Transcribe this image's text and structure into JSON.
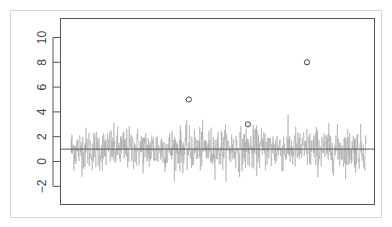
{
  "chart_data": {
    "type": "line",
    "title": "",
    "xlabel": "",
    "ylabel": "",
    "ylim": [
      -3.5,
      11.2
    ],
    "xlim": [
      1,
      1000
    ],
    "x_axis_visible": false,
    "grid": false,
    "legend": null,
    "y_ticks": [
      -2,
      0,
      2,
      4,
      6,
      8,
      10
    ],
    "y_tick_labels": [
      "−2",
      "0",
      "2",
      "4",
      "6",
      "8",
      "10"
    ],
    "series": [
      {
        "name": "noise",
        "type": "line",
        "color": "#aaaaaa",
        "n": 1000,
        "mean": 1,
        "sd": 0.85,
        "range_approx": [
          -1.6,
          4.0
        ],
        "description": "random noise series around mean 1"
      },
      {
        "name": "outliers",
        "type": "scatter",
        "marker": "open-circle",
        "color": "#444444",
        "points": [
          {
            "x": 400,
            "y": 5
          },
          {
            "x": 600,
            "y": 3
          },
          {
            "x": 800,
            "y": 8
          }
        ]
      },
      {
        "name": "reference-line",
        "type": "hline",
        "color": "#555555",
        "y": 1
      }
    ]
  }
}
